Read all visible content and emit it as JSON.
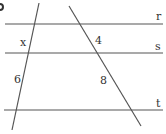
{
  "diagram": {
    "type": "parallel-lines-transversals",
    "parallel_lines": [
      {
        "name": "r",
        "y": 24
      },
      {
        "name": "s",
        "y": 53
      },
      {
        "name": "t",
        "y": 110
      }
    ],
    "transversals": [
      {
        "name": "left",
        "x1": 39,
        "y1": 3,
        "x2": 12,
        "y2": 130
      },
      {
        "name": "right",
        "x1": 69,
        "y1": 6,
        "x2": 141,
        "y2": 126
      }
    ],
    "segment_labels": {
      "left_upper": "x",
      "left_lower": "6",
      "right_upper": "4",
      "right_lower": "8"
    },
    "line_labels": {
      "r": "r",
      "s": "s",
      "t": "t"
    },
    "colors": {
      "line": "#555555",
      "text": "#333333"
    }
  }
}
